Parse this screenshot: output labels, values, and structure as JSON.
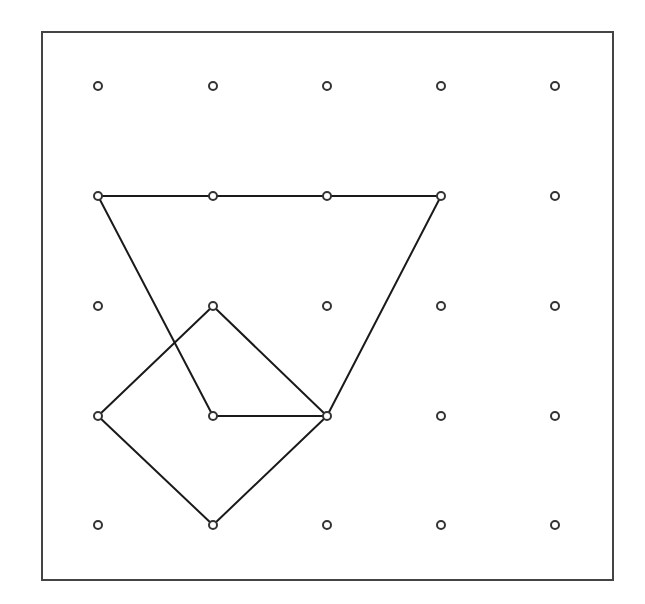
{
  "diagram": {
    "type": "geoboard",
    "grid": {
      "cols": 5,
      "rows": 5
    },
    "board_frame": {
      "x": 42,
      "y": 32,
      "width": 571,
      "height": 548
    },
    "peg_x": [
      98,
      213,
      327,
      441,
      555
    ],
    "peg_y": [
      86,
      196,
      306,
      416,
      525
    ],
    "colors": {
      "line": "#1a1a1a",
      "peg": "#333333",
      "frame": "#444444",
      "background": "#ffffff"
    },
    "shapes": [
      {
        "name": "trapezoid",
        "points": [
          [
            0,
            1
          ],
          [
            3,
            1
          ],
          [
            2,
            3
          ],
          [
            1,
            3
          ]
        ]
      },
      {
        "name": "square",
        "points": [
          [
            1,
            2
          ],
          [
            2,
            3
          ],
          [
            1,
            4
          ],
          [
            0,
            3
          ]
        ]
      }
    ]
  }
}
